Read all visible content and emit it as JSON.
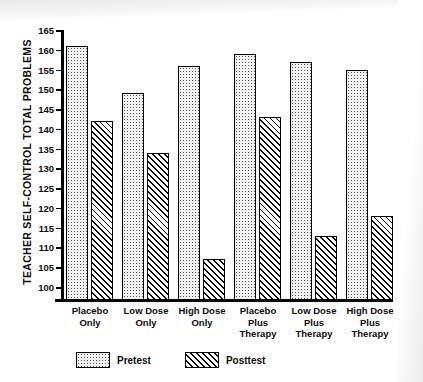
{
  "chart_data": {
    "type": "bar",
    "title": "",
    "subtitle": "",
    "xlabel": "",
    "ylabel": "TEACHER SELF-CONTROL TOTAL PROBLEMS",
    "ylim": [
      100,
      165
    ],
    "ytick_step": 5,
    "yticks": [
      100,
      105,
      110,
      115,
      120,
      125,
      130,
      135,
      140,
      145,
      150,
      155,
      160,
      165
    ],
    "grid": false,
    "legend_position": "bottom-left",
    "categories": [
      "Placebo Only",
      "Low Dose Only",
      "High Dose Only",
      "Placebo Plus Therapy",
      "Low Dose Plus Therapy",
      "High Dose Plus Therapy"
    ],
    "category_lines": [
      [
        "Placebo",
        "Only"
      ],
      [
        "Low Dose",
        "Only"
      ],
      [
        "High Dose",
        "Only"
      ],
      [
        "Placebo",
        "Plus",
        "Therapy"
      ],
      [
        "Low Dose",
        "Plus",
        "Therapy"
      ],
      [
        "High Dose",
        "Plus",
        "Therapy"
      ]
    ],
    "series": [
      {
        "name": "Pretest",
        "pattern": "stippled",
        "values": [
          161,
          149,
          156,
          159,
          157,
          155
        ]
      },
      {
        "name": "Posttest",
        "pattern": "diagonal-hatch",
        "values": [
          142,
          134,
          107,
          143,
          113,
          118
        ]
      }
    ]
  },
  "legend": {
    "entries": [
      {
        "label": "Pretest",
        "swatch": "pretest-swatch"
      },
      {
        "label": "Posttest",
        "swatch": "posttest-swatch"
      }
    ]
  },
  "colors": {
    "ink": "#000000",
    "background": "#ffffff",
    "pretest_fill": "#f2f2f2",
    "posttest_fill": "#ffffff"
  }
}
